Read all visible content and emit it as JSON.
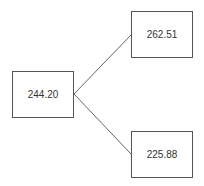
{
  "diagram": {
    "type": "tree",
    "nodes": [
      {
        "id": "root",
        "label": "244.20",
        "x": 12,
        "y": 71
      },
      {
        "id": "up",
        "label": "262.51",
        "x": 131,
        "y": 11
      },
      {
        "id": "down",
        "label": "225.88",
        "x": 131,
        "y": 131
      }
    ],
    "edges": [
      {
        "from": "root",
        "to": "up"
      },
      {
        "from": "root",
        "to": "down"
      }
    ],
    "colors": {
      "line": "#555555",
      "text": "#333333",
      "background": "#ffffff"
    }
  }
}
